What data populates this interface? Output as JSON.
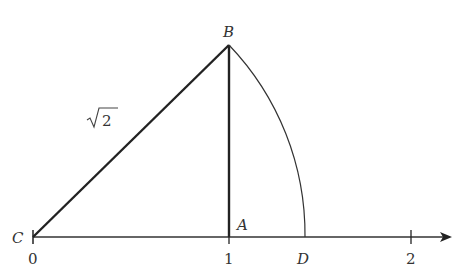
{
  "diagram": {
    "points": {
      "C": "C",
      "B": "B",
      "A": "A",
      "D": "D"
    },
    "ticks": [
      "0",
      "1",
      "2"
    ],
    "hypotenuse_label_radical": "√",
    "hypotenuse_label_value": "2",
    "colors": {
      "stroke": "#222222",
      "text": "#333333",
      "background": "#ffffff"
    }
  }
}
